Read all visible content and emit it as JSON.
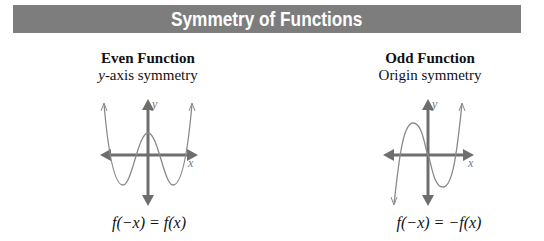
{
  "banner": {
    "title": "Symmetry of Functions",
    "background": "#7d7d7d"
  },
  "panels": [
    {
      "title": "Even Function",
      "subtitle_var": "y",
      "subtitle_rest": "-axis symmetry",
      "formula": "f(−x) = f(x)",
      "axis_labels": {
        "x": "x",
        "y": "y"
      }
    },
    {
      "title": "Odd Function",
      "subtitle": "Origin symmetry",
      "formula": "f(−x) = −f(x)",
      "axis_labels": {
        "x": "x",
        "y": "y"
      }
    }
  ],
  "colors": {
    "axis": "#6e6e6e",
    "curve": "#8a8a8a",
    "text": "#111111"
  }
}
